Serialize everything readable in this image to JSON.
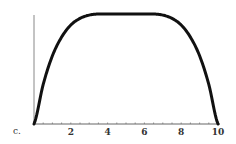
{
  "chart_data": {
    "type": "line",
    "panel_label": "c.",
    "title": "",
    "xlabel": "",
    "ylabel": "",
    "xlim": [
      0,
      10
    ],
    "x_ticks": [
      2,
      4,
      6,
      8,
      10
    ],
    "x_tick_labels": [
      "2",
      "4",
      "6",
      "8",
      "10"
    ],
    "grid": false,
    "series": [
      {
        "name": "curve",
        "x": [
          0,
          0.5,
          1,
          1.5,
          2,
          2.5,
          3,
          3.5,
          4,
          5,
          6,
          6.5,
          7,
          7.5,
          8,
          8.5,
          9,
          9.5,
          10
        ],
        "y": [
          0,
          0.36,
          0.62,
          0.79,
          0.9,
          0.96,
          0.99,
          1.0,
          1.0,
          1.0,
          1.0,
          1.0,
          0.99,
          0.96,
          0.9,
          0.79,
          0.62,
          0.36,
          0
        ],
        "color": "#111111"
      }
    ]
  }
}
